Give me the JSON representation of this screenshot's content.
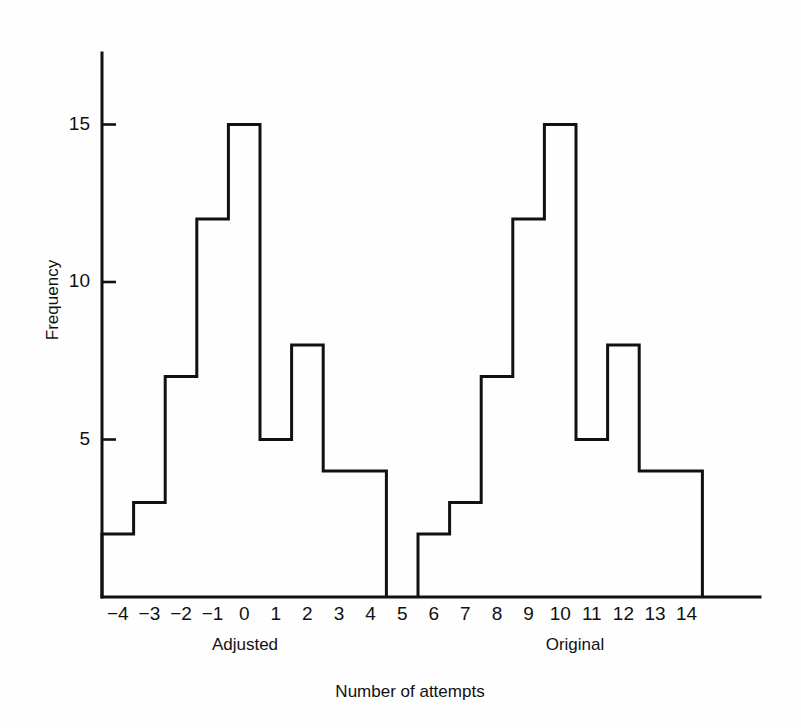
{
  "chart_data": {
    "type": "bar",
    "title": "",
    "subtitle": "",
    "xlabel": "Number of attempts",
    "ylabel": "Frequency",
    "categories": [
      "-4",
      "-3",
      "-2",
      "-1",
      "0",
      "1",
      "2",
      "3",
      "4",
      "5",
      "6",
      "7",
      "8",
      "9",
      "10",
      "11",
      "12",
      "13",
      "14"
    ],
    "values": [
      2,
      3,
      7,
      12,
      15,
      5,
      8,
      4,
      4,
      0,
      2,
      3,
      7,
      12,
      15,
      5,
      8,
      4,
      4
    ],
    "ylim": [
      0,
      17
    ],
    "xlim": [
      -4.5,
      15.5
    ],
    "y_ticks": [
      5,
      10,
      15
    ],
    "y_tick_labels": [
      "5",
      "10",
      "15"
    ],
    "grid": false,
    "legend": "none",
    "bar_fill": "#ffffff",
    "bar_edge_color": "#111111",
    "axis_color": "#111111",
    "background": "#fefefe",
    "groups": [
      {
        "label": "Adjusted",
        "from_category": "-4",
        "to_category": "5"
      },
      {
        "label": "Original",
        "from_category": "6",
        "to_category": "14"
      }
    ],
    "annotations": []
  },
  "figure": {
    "x_axis_title": "Number of attempts",
    "y_axis_title": "Frequency",
    "group_left": "Adjusted",
    "group_right": "Original"
  }
}
